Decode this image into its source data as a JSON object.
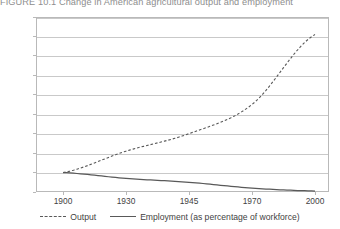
{
  "figure": {
    "number": "FIGURE 10.1",
    "caption": "Change in American agricultural output and employment",
    "full_title": "FIGURE 10.1  Change in American agricultural output and employment"
  },
  "colors": {
    "series_line": "#595959",
    "gridline": "#c9c9c9",
    "frame": "#b9b9b9",
    "text": "#3f3f3f",
    "title_text": "#8d8d8d",
    "background": "#ffffff"
  },
  "legend": {
    "position": "bottom-center",
    "items": [
      {
        "label": "Output",
        "style": "dashed",
        "marker": "dashed-line-swatch"
      },
      {
        "label": "Employment (as percentage of workforce)",
        "style": "solid",
        "marker": "solid-line-swatch"
      }
    ]
  },
  "axes": {
    "y_ticks": [
      "900",
      "800",
      "700",
      "600",
      "500",
      "400",
      "300",
      "200",
      "100",
      "0"
    ],
    "x_ticks": [
      "1900",
      "1930",
      "1945",
      "1970",
      "2000"
    ]
  },
  "chart_data": {
    "type": "line",
    "title": "Change in American agricultural output and employment",
    "subtitle": "",
    "xlabel": "",
    "ylabel": "",
    "categories": [
      "1900",
      "1930",
      "1945",
      "1970",
      "2000"
    ],
    "x": [
      1900,
      1930,
      1945,
      1970,
      2000
    ],
    "ylim": [
      0,
      900
    ],
    "yticks": [
      0,
      100,
      200,
      300,
      400,
      500,
      600,
      700,
      800,
      900
    ],
    "grid": true,
    "legend_position": "bottom-center",
    "x_axis_type": "categorical-evenly-spaced",
    "series": [
      {
        "name": "Output",
        "style": "dashed",
        "color": "#595959",
        "values": [
          100,
          210,
          300,
          450,
          810
        ]
      },
      {
        "name": "Employment (as percentage of workforce)",
        "style": "solid",
        "color": "#595959",
        "values": [
          100,
          70,
          50,
          20,
          5
        ]
      }
    ],
    "annotations": []
  }
}
